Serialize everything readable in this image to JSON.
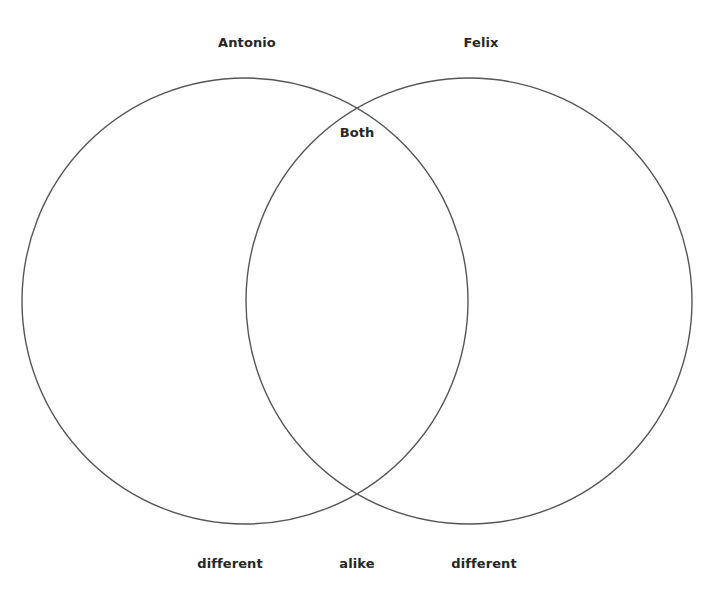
{
  "diagram": {
    "type": "venn",
    "stroke_color": "#555555",
    "background": "#ffffff",
    "sets": [
      {
        "name": "Antonio",
        "cx": 245,
        "cy": 301,
        "r": 223
      },
      {
        "name": "Felix",
        "cx": 469,
        "cy": 301,
        "r": 223
      }
    ],
    "titles": {
      "left": "Antonio",
      "right": "Felix",
      "overlap": "Both"
    },
    "footer": {
      "left": "different",
      "center": "alike",
      "right": "different"
    }
  }
}
